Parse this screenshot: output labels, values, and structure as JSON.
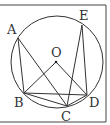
{
  "figure": {
    "type": "circle-geometry",
    "circle_label": "circle O",
    "center": {
      "label": "O"
    },
    "points": [
      {
        "id": "A",
        "label": "A"
      },
      {
        "id": "B",
        "label": "B"
      },
      {
        "id": "C",
        "label": "C"
      },
      {
        "id": "D",
        "label": "D"
      },
      {
        "id": "E",
        "label": "E"
      }
    ],
    "segments": [
      [
        "A",
        "B"
      ],
      [
        "A",
        "C"
      ],
      [
        "B",
        "O"
      ],
      [
        "O",
        "D"
      ],
      [
        "B",
        "C"
      ],
      [
        "B",
        "D"
      ],
      [
        "C",
        "E"
      ],
      [
        "E",
        "D"
      ],
      [
        "C",
        "D"
      ]
    ],
    "colors": {
      "stroke": "#333333",
      "frame": "#444444",
      "background": "#ffffff"
    }
  }
}
